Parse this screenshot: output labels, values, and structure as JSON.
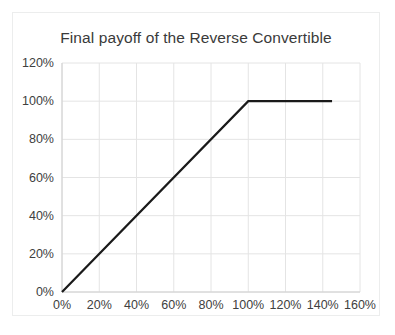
{
  "chart_data": {
    "type": "line",
    "title": "Final payoff of the Reverse Convertible",
    "xlabel": "",
    "ylabel": "",
    "xlim": [
      0,
      160
    ],
    "ylim": [
      0,
      120
    ],
    "xtick_labels": [
      "0%",
      "20%",
      "40%",
      "60%",
      "80%",
      "100%",
      "120%",
      "140%",
      "160%"
    ],
    "xtick_values": [
      0,
      20,
      40,
      60,
      80,
      100,
      120,
      140,
      160
    ],
    "ytick_labels": [
      "0%",
      "20%",
      "40%",
      "60%",
      "80%",
      "100%",
      "120%"
    ],
    "ytick_values": [
      0,
      20,
      40,
      60,
      80,
      100,
      120
    ],
    "grid": true,
    "legend": "none",
    "series": [
      {
        "name": "Final payoff",
        "color": "#1a1a1a",
        "line_width": 2.2,
        "x": [
          0,
          100,
          145
        ],
        "y": [
          0,
          100,
          100
        ]
      }
    ]
  },
  "colors": {
    "line": "#1a1a1a",
    "grid": "#e4e4e4",
    "axis": "#d0d0d0",
    "text": "#404040",
    "title": "#3a3a3a",
    "card_border": "#eceded",
    "background": "#ffffff"
  }
}
